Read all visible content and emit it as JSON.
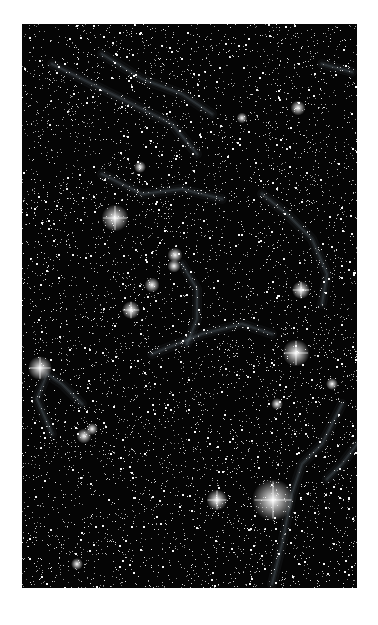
{
  "image": {
    "subject": "star field with faint nebula filaments (supernova remnant)",
    "frame": {
      "x": 22,
      "y": 24,
      "width": 335,
      "height": 564
    },
    "background_color": "#050505",
    "page_background": "#ffffff",
    "nebula_color": "#8a9aa8",
    "star_color": "#ffffff",
    "star_density": 6500,
    "seed": 1337,
    "bright_stars": [
      {
        "x": 93,
        "y": 194,
        "r": 4.5
      },
      {
        "x": 274,
        "y": 329,
        "r": 4.5
      },
      {
        "x": 251,
        "y": 476,
        "r": 7
      },
      {
        "x": 195,
        "y": 476,
        "r": 3.5
      },
      {
        "x": 18,
        "y": 344,
        "r": 4
      },
      {
        "x": 109,
        "y": 286,
        "r": 3
      },
      {
        "x": 279,
        "y": 266,
        "r": 3
      },
      {
        "x": 153,
        "y": 231,
        "r": 2.5
      },
      {
        "x": 130,
        "y": 261,
        "r": 2.5
      },
      {
        "x": 276,
        "y": 84,
        "r": 2.5
      },
      {
        "x": 152,
        "y": 242,
        "r": 2.2
      },
      {
        "x": 62,
        "y": 412,
        "r": 2.5
      },
      {
        "x": 70,
        "y": 405,
        "r": 2
      },
      {
        "x": 118,
        "y": 143,
        "r": 2
      },
      {
        "x": 310,
        "y": 360,
        "r": 2
      },
      {
        "x": 55,
        "y": 540,
        "r": 2
      },
      {
        "x": 220,
        "y": 94,
        "r": 1.8
      },
      {
        "x": 255,
        "y": 380,
        "r": 2
      }
    ],
    "filaments": [
      [
        [
          30,
          40
        ],
        [
          70,
          60
        ],
        [
          110,
          80
        ],
        [
          150,
          100
        ],
        [
          175,
          130
        ]
      ],
      [
        [
          80,
          30
        ],
        [
          120,
          55
        ],
        [
          160,
          70
        ],
        [
          190,
          90
        ]
      ],
      [
        [
          240,
          170
        ],
        [
          265,
          190
        ],
        [
          290,
          215
        ],
        [
          305,
          250
        ],
        [
          300,
          280
        ]
      ],
      [
        [
          300,
          40
        ],
        [
          330,
          48
        ]
      ],
      [
        [
          160,
          240
        ],
        [
          175,
          265
        ],
        [
          175,
          295
        ],
        [
          165,
          320
        ]
      ],
      [
        [
          60,
          380
        ],
        [
          40,
          360
        ],
        [
          25,
          350
        ],
        [
          15,
          375
        ],
        [
          30,
          410
        ]
      ],
      [
        [
          130,
          330
        ],
        [
          180,
          310
        ],
        [
          220,
          300
        ],
        [
          250,
          310
        ]
      ],
      [
        [
          320,
          380
        ],
        [
          300,
          420
        ],
        [
          280,
          440
        ],
        [
          270,
          470
        ],
        [
          260,
          520
        ],
        [
          250,
          560
        ]
      ],
      [
        [
          335,
          420
        ],
        [
          320,
          440
        ],
        [
          305,
          455
        ]
      ],
      [
        [
          80,
          150
        ],
        [
          120,
          170
        ],
        [
          160,
          165
        ],
        [
          200,
          175
        ]
      ]
    ]
  },
  "captions": {
    "top_right": "",
    "bottom": ""
  }
}
